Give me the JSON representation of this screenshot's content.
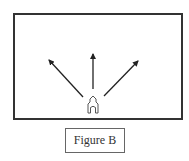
{
  "figure": {
    "caption": "Figure B",
    "colors": {
      "frame": "#333333",
      "arrows": "#222222",
      "icon": "#555555",
      "caption_border": "#666666",
      "text": "#333333"
    },
    "origin_icon": "house-icon",
    "arrows": [
      {
        "direction": "up-left"
      },
      {
        "direction": "up"
      },
      {
        "direction": "up-right"
      }
    ]
  }
}
